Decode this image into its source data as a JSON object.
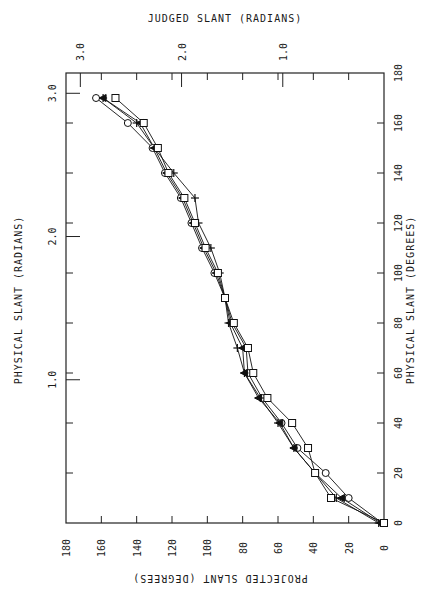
{
  "chart_data": {
    "type": "line",
    "title": "",
    "xlabel": "PROJECTED SLANT (DEGREES)",
    "ylabel": "PHYSICAL SLANT (DEGREES)",
    "top_xlabel": "JUDGED SLANT (RADIANS)",
    "left_ylabel": "PHYSICAL SLANT (RADIANS)",
    "xlim": [
      180,
      0
    ],
    "ylim": [
      0,
      180
    ],
    "x_ticks": [
      "180",
      "160",
      "140",
      "120",
      "100",
      "80",
      "60",
      "40",
      "20",
      "0"
    ],
    "y_ticks": [
      "0",
      "20",
      "40",
      "60",
      "80",
      "100",
      "120",
      "140",
      "160",
      "180"
    ],
    "top_ticks": [
      "3.0",
      "2.0",
      "1.0"
    ],
    "left_ticks": [
      "3.0",
      "2.0",
      "1.0"
    ],
    "grid": false,
    "legend": null,
    "note": "Figure is printed rotated 90 degrees; bottom-axis labels appear upside-down.",
    "physical_slant": [
      0,
      10,
      20,
      30,
      40,
      50,
      60,
      70,
      80,
      90,
      100,
      110,
      120,
      130,
      140,
      150,
      160,
      170
    ],
    "series": [
      {
        "name": "circle",
        "marker": "circle",
        "projected_slant": [
          1,
          20,
          33,
          49,
          58,
          69,
          77,
          78,
          86,
          90,
          96,
          103,
          109,
          115,
          124,
          131,
          145,
          163
        ]
      },
      {
        "name": "triangle",
        "marker": "triangle",
        "projected_slant": [
          2,
          24,
          39,
          51,
          59,
          71,
          79,
          80,
          87,
          90,
          95,
          102,
          108,
          114,
          123,
          130,
          138,
          159
        ]
      },
      {
        "name": "plus",
        "marker": "plus",
        "projected_slant": [
          3,
          27,
          39,
          51,
          60,
          70,
          79,
          83,
          88,
          90,
          93,
          98,
          105,
          107,
          119,
          130,
          140,
          159
        ]
      },
      {
        "name": "square",
        "marker": "square",
        "projected_slant": [
          0,
          30,
          39,
          43,
          52,
          66,
          74,
          77,
          85,
          90,
          94,
          101,
          107,
          113,
          122,
          128,
          136,
          152
        ]
      }
    ]
  }
}
